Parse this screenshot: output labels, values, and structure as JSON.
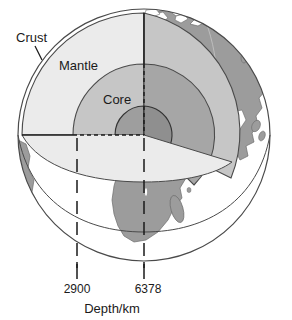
{
  "figure": {
    "name": "earth-internal-structure-cutaway",
    "axis_caption": "Depth/km",
    "labels": {
      "crust": "Crust",
      "mantle": "Mantle",
      "core": "Core"
    },
    "depth_ticks": [
      {
        "value": "2900",
        "layer": "core-mantle boundary"
      },
      {
        "value": "6378",
        "layer": "Earth centre / radius"
      }
    ],
    "colors": {
      "background": "#ffffff",
      "outline": "#4a4a4a",
      "mantle_fill": "#ebebeb",
      "mantle_wall": "#e2e2e2",
      "outer_core_fill": "#c6c6c6",
      "outer_core_wall": "#a6a6a6",
      "inner_core_fill": "#9e9e9e",
      "inner_core_wall": "#8a8a8a",
      "land_fill": "#9c9c9c",
      "ocean_fill": "#ffffff",
      "text": "#1a1a1a",
      "leader_line": "#1a1a1a",
      "dashed_line": "#1a1a1a"
    },
    "geometry": {
      "center_x": 144,
      "center_y": 135,
      "radius": 126,
      "mantle_radius": 122,
      "outer_core_radius": 71,
      "inner_core_radius": 29,
      "tick_2900_x": 77,
      "tick_6378_x": 144,
      "baseline_y": 268
    }
  }
}
